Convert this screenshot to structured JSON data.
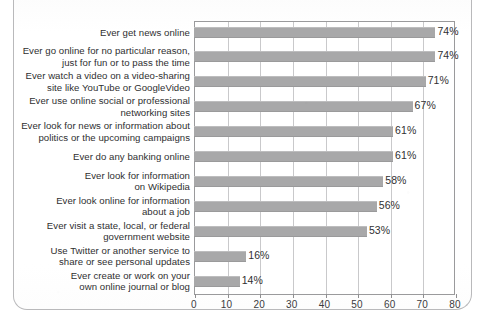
{
  "chart_data": {
    "type": "bar",
    "orientation": "horizontal",
    "title": "",
    "xlabel": "",
    "ylabel": "",
    "xlim": [
      0,
      80
    ],
    "xticks": [
      0,
      10,
      20,
      30,
      40,
      50,
      60,
      70,
      80
    ],
    "xtick_labels": [
      "0",
      "10",
      "20",
      "30",
      "40",
      "50",
      "60",
      "70",
      "80"
    ],
    "grid": "vertical",
    "legend": "none",
    "bar_color": "#a8a8a9",
    "categories": [
      "Ever get news online",
      "Ever go online for no particular reason, just for fun or to pass the time",
      "Ever watch a video on a video-sharing site like YouTube or GoogleVideo",
      "Ever use online social or professional networking sites",
      "Ever look for news or information about politics or the upcoming campaigns",
      "Ever do any banking online",
      "Ever look for information on Wikipedia",
      "Ever look online for information about a job",
      "Ever visit a state, local, or federal government website",
      "Use Twitter or another service to share or see personal updates",
      "Ever create or work on your own online journal or blog"
    ],
    "category_lines": [
      [
        "Ever get news online"
      ],
      [
        "Ever go online for no particular reason,",
        "just for fun or to pass the time"
      ],
      [
        "Ever watch a video on a video-sharing",
        "site like YouTube or GoogleVideo"
      ],
      [
        "Ever use online social or professional",
        "networking sites"
      ],
      [
        "Ever look for news or information about",
        "politics or the upcoming campaigns"
      ],
      [
        "Ever do any banking online"
      ],
      [
        "Ever look for information",
        "on Wikipedia"
      ],
      [
        "Ever look online for information",
        "about a job"
      ],
      [
        "Ever visit a state, local, or federal",
        "government website"
      ],
      [
        "Use Twitter or another service to",
        "share or see personal updates"
      ],
      [
        "Ever create or work on your",
        "own online journal or blog"
      ]
    ],
    "values": [
      74,
      74,
      71,
      67,
      61,
      61,
      58,
      56,
      53,
      16,
      14
    ],
    "value_labels": [
      "74%",
      "74%",
      "71%",
      "67%",
      "61%",
      "61%",
      "58%",
      "56%",
      "53%",
      "16%",
      "14%"
    ]
  }
}
